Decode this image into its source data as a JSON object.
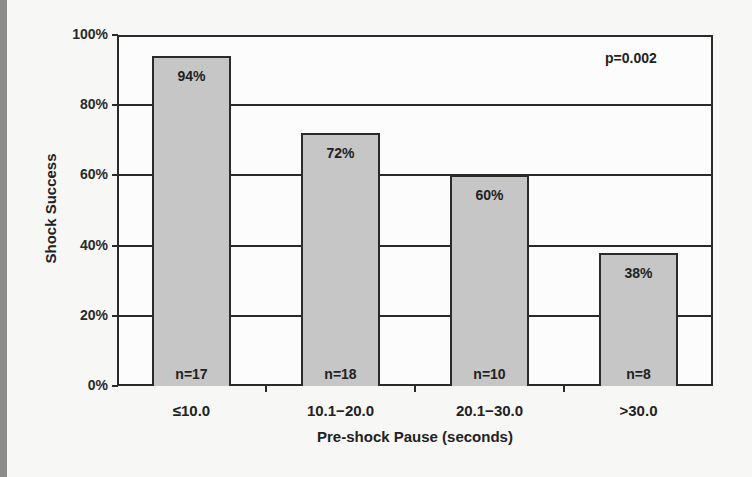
{
  "chart_data": {
    "type": "bar",
    "title": "",
    "xlabel": "Pre-shock Pause (seconds)",
    "ylabel": "Shock Success",
    "categories": [
      "≤10.0",
      "10.1−20.0",
      "20.1−30.0",
      ">30.0"
    ],
    "values": [
      94,
      72,
      60,
      38
    ],
    "value_labels": [
      "94%",
      "72%",
      "60%",
      "38%"
    ],
    "n_labels": [
      "n=17",
      "n=18",
      "n=10",
      "n=8"
    ],
    "n": [
      17,
      18,
      10,
      8
    ],
    "ylim": [
      0,
      100
    ],
    "yticks": [
      "0%",
      "20%",
      "40%",
      "60%",
      "80%",
      "100%"
    ],
    "grid": true,
    "annotation": "p=0.002",
    "legend": null,
    "bar_color": "#c6c6c6"
  },
  "labels": {
    "ylabel": "Shock Success",
    "xlabel": "Pre-shock Pause (seconds)",
    "pvalue": "p=0.002"
  }
}
